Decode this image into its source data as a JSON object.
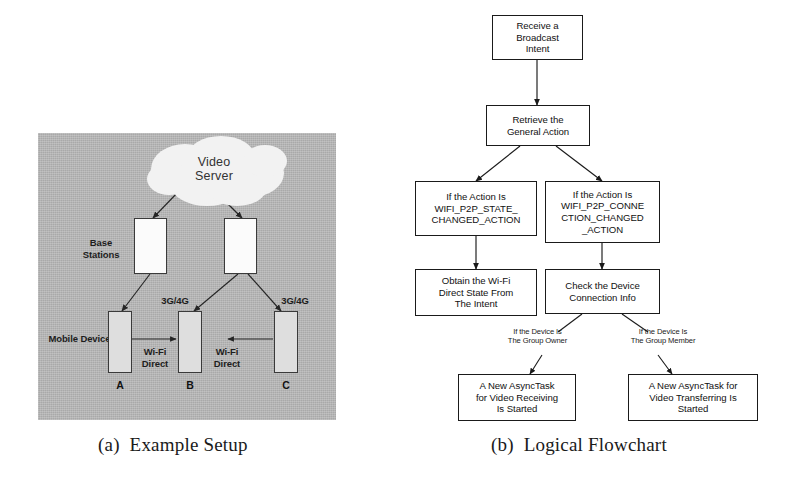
{
  "figure": {
    "subfigures": [
      {
        "id": "a",
        "caption": "(a)  Example Setup"
      },
      {
        "id": "b",
        "caption": "(b)  Logical Flowchart"
      }
    ]
  },
  "panel_a": {
    "title": "Example Setup",
    "background_color": "#b3b3b3",
    "cloud": {
      "label": "Video\nServer",
      "fill": "#f2f2f2"
    },
    "row_labels": [
      {
        "name": "base-stations",
        "text": "Base\nStations"
      },
      {
        "name": "mobile-devices",
        "text": "Mobile Devices"
      }
    ],
    "base_stations": [
      {
        "name": "base-station-1",
        "fill": "#fbfbfb"
      },
      {
        "name": "base-station-2",
        "fill": "#fbfbfb"
      }
    ],
    "mobile_devices": [
      {
        "name": "device-a",
        "letter": "A",
        "fill": "#dedede"
      },
      {
        "name": "device-b",
        "letter": "B",
        "fill": "#dedede"
      },
      {
        "name": "device-c",
        "letter": "C",
        "fill": "#dedede"
      }
    ],
    "link_labels": [
      {
        "name": "link-3g4g-left",
        "text": "3G/4G"
      },
      {
        "name": "link-3g4g-right",
        "text": "3G/4G"
      },
      {
        "name": "link-wifi-direct-left",
        "text": "Wi-Fi\nDirect"
      },
      {
        "name": "link-wifi-direct-right",
        "text": "Wi-Fi\nDirect"
      }
    ]
  },
  "panel_b": {
    "title": "Logical Flowchart",
    "boxes": [
      {
        "name": "receive-broadcast-intent",
        "text": "Receive a\nBroadcast\nIntent"
      },
      {
        "name": "retrieve-general-action",
        "text": "Retrieve the\nGeneral Action"
      },
      {
        "name": "condition-wifi-p2p-state",
        "text": "If the Action Is\nWIFI_P2P_STATE_\nCHANGED_ACTION"
      },
      {
        "name": "condition-wifi-p2p-connection",
        "text": "If the Action Is\nWIFI_P2P_CONNE\nCTION_CHANGED\n_ACTION"
      },
      {
        "name": "obtain-wifi-direct-state",
        "text": "Obtain the Wi-Fi\nDirect State From\nThe Intent"
      },
      {
        "name": "check-device-connection-info",
        "text": "Check the Device\nConnection Info"
      },
      {
        "name": "asynctask-video-receiving",
        "text": "A New AsyncTask\nfor Video Receiving\nIs Started"
      },
      {
        "name": "asynctask-video-transferring",
        "text": "A New AsyncTask for\nVideo Transferring Is\nStarted"
      }
    ],
    "edge_labels": [
      {
        "name": "edge-label-group-owner",
        "text": "If the Device Is\nThe Group Owner"
      },
      {
        "name": "edge-label-group-member",
        "text": "If the Device Is\nThe Group Member"
      }
    ]
  },
  "colors": {
    "panel_background": "#b3b3b3",
    "box_stroke": "#1a1a1a",
    "box_fill": "#ffffff",
    "device_fill": "#dedede",
    "station_fill": "#fbfbfb",
    "cloud_fill": "#f2f2f2",
    "text": "#111111"
  }
}
